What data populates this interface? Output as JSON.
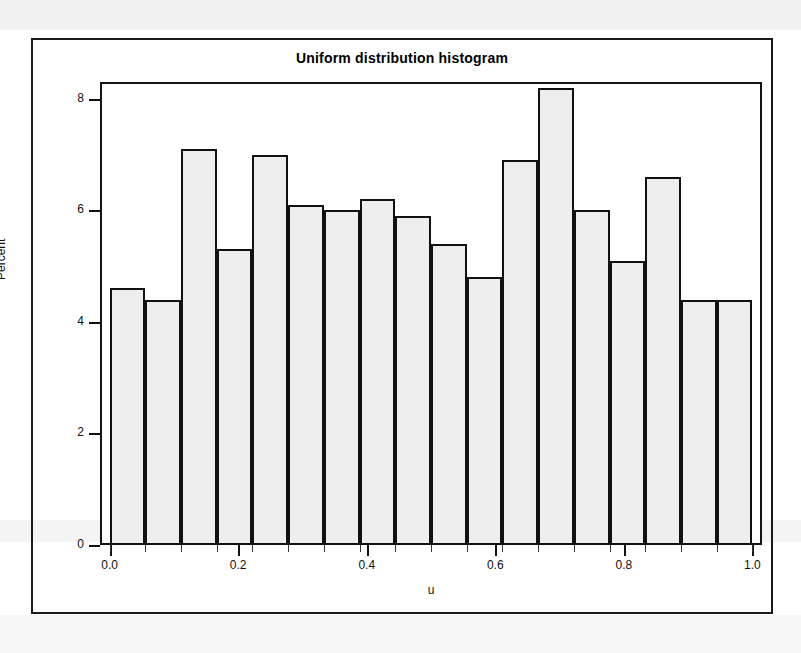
{
  "figure": {
    "title": "Uniform distribution histogram",
    "background_color": "#ffffff",
    "frame_color": "#1a1a1a",
    "bar_fill_color": "#eeeeee",
    "bar_edge_color": "#111111"
  },
  "chart_data": {
    "type": "bar",
    "title": "Uniform distribution histogram",
    "xlabel": "u",
    "ylabel": "Percent",
    "xlim": [
      -0.015,
      1.015
    ],
    "ylim": [
      0,
      8.3
    ],
    "xticks": [
      0.0,
      0.2,
      0.4,
      0.6,
      0.8,
      1.0
    ],
    "xticklabels": [
      "0.0",
      "0.2",
      "0.4",
      "0.6",
      "0.8",
      "1.0"
    ],
    "yticks": [
      0,
      2,
      4,
      6,
      8
    ],
    "yticklabels": [
      "0",
      "2",
      "4",
      "6",
      "8"
    ],
    "grid": false,
    "legend": false,
    "bin_count": 18,
    "bin_width": 0.0556,
    "bin_edges": [
      0.0,
      0.0556,
      0.1111,
      0.1667,
      0.2222,
      0.2778,
      0.3333,
      0.3889,
      0.4444,
      0.5,
      0.5556,
      0.6111,
      0.6667,
      0.7222,
      0.7778,
      0.8333,
      0.8889,
      0.9444,
      1.0
    ],
    "bin_centers": [
      0.0278,
      0.0833,
      0.1389,
      0.1944,
      0.25,
      0.3056,
      0.3611,
      0.4167,
      0.4722,
      0.5278,
      0.5833,
      0.6389,
      0.6944,
      0.75,
      0.8056,
      0.8611,
      0.9167,
      0.9722
    ],
    "categories": [
      "0.028",
      "0.083",
      "0.139",
      "0.194",
      "0.250",
      "0.306",
      "0.361",
      "0.417",
      "0.472",
      "0.528",
      "0.583",
      "0.639",
      "0.694",
      "0.750",
      "0.806",
      "0.861",
      "0.917",
      "0.972"
    ],
    "values": [
      4.6,
      4.4,
      7.1,
      5.3,
      7.0,
      6.1,
      6.0,
      6.2,
      5.9,
      5.4,
      4.8,
      6.9,
      8.2,
      6.0,
      5.1,
      6.6,
      4.4,
      4.4
    ]
  },
  "axes": {
    "y_title": "Percent",
    "x_title": "u"
  }
}
